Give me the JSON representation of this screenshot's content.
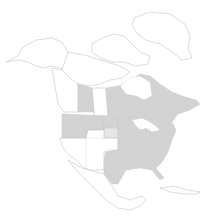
{
  "map": {
    "title": "North America distribution map",
    "colors": {
      "background": "#ffffff",
      "present": "#d3d3d3",
      "present_light": "#e6e6e6",
      "absent": "#ffffff",
      "outline": "#b9b9b9"
    },
    "legend": [],
    "regions_present": [
      "Alberta",
      "Manitoba",
      "Ontario",
      "Quebec",
      "New Brunswick",
      "Nova Scotia",
      "Washington",
      "Idaho",
      "Montana",
      "North Dakota",
      "Minnesota",
      "Eastern United States",
      "Texas",
      "Oklahoma",
      "Florida"
    ],
    "regions_light": [
      "South Dakota",
      "Vermont"
    ]
  }
}
